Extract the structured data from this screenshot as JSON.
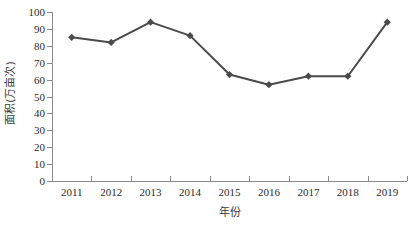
{
  "chart_data": {
    "type": "line",
    "title": "",
    "subtitle": "",
    "xlabel": "年份",
    "ylabel": "面积(万亩次)",
    "categories": [
      "2011",
      "2012",
      "2013",
      "2014",
      "2015",
      "2016",
      "2017",
      "2018",
      "2019"
    ],
    "values": [
      85,
      82,
      94,
      86,
      63,
      57,
      62,
      62,
      94
    ],
    "series": [
      {
        "name": "面积",
        "values": [
          85,
          82,
          94,
          86,
          63,
          57,
          62,
          62,
          94
        ]
      }
    ],
    "ylim": [
      0,
      100
    ],
    "y_ticks": [
      "0",
      "10",
      "20",
      "30",
      "40",
      "50",
      "60",
      "70",
      "80",
      "90",
      "100"
    ],
    "y_tick_values": [
      0,
      10,
      20,
      30,
      40,
      50,
      60,
      70,
      80,
      90,
      100
    ],
    "x_ticks": [
      "2011",
      "2012",
      "2013",
      "2014",
      "2015",
      "2016",
      "2017",
      "2018",
      "2019"
    ],
    "grid": false,
    "legend": false,
    "legend_position": "none",
    "marker": "diamond",
    "line_color": "#4a4a4a",
    "marker_color": "#4a4a4a",
    "axis_color": "#8a8a8a",
    "background": "#ffffff"
  }
}
